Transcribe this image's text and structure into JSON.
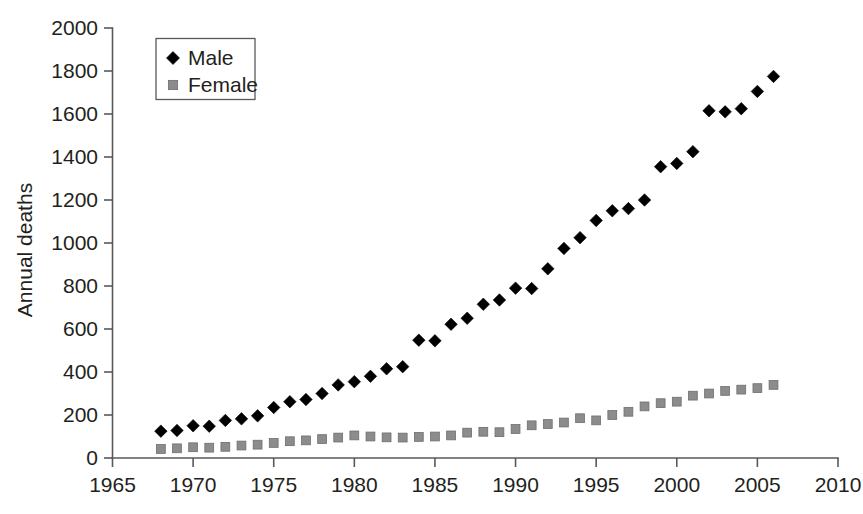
{
  "chart_data": {
    "type": "scatter",
    "title": "",
    "xlabel": "",
    "ylabel": "Annual deaths",
    "xlim": [
      1965,
      2010
    ],
    "ylim": [
      0,
      2000
    ],
    "xticks": [
      1965,
      1970,
      1975,
      1980,
      1985,
      1990,
      1995,
      2000,
      2005,
      2010
    ],
    "yticks": [
      0,
      200,
      400,
      600,
      800,
      1000,
      1200,
      1400,
      1600,
      1800,
      2000
    ],
    "grid": false,
    "legend_position": "top-left",
    "series": [
      {
        "name": "Male",
        "marker": "diamond",
        "color": "#000000",
        "x": [
          1968,
          1969,
          1970,
          1971,
          1972,
          1973,
          1974,
          1975,
          1976,
          1977,
          1978,
          1979,
          1980,
          1981,
          1982,
          1983,
          1984,
          1985,
          1986,
          1987,
          1988,
          1989,
          1990,
          1991,
          1992,
          1993,
          1994,
          1995,
          1996,
          1997,
          1998,
          1999,
          2000,
          2001,
          2002,
          2003,
          2004,
          2005,
          2006
        ],
        "values": [
          125,
          128,
          150,
          148,
          175,
          182,
          196,
          235,
          262,
          272,
          300,
          340,
          355,
          380,
          415,
          425,
          548,
          545,
          622,
          650,
          715,
          735,
          790,
          788,
          880,
          975,
          1025,
          1105,
          1150,
          1160,
          1200,
          1355,
          1370,
          1425,
          1615,
          1610,
          1625,
          1705,
          1775
        ],
        "label_last": 1775
      },
      {
        "name": "Female",
        "marker": "square",
        "color": "#8c8c8c",
        "x": [
          1968,
          1969,
          1970,
          1971,
          1972,
          1973,
          1974,
          1975,
          1976,
          1977,
          1978,
          1979,
          1980,
          1981,
          1982,
          1983,
          1984,
          1985,
          1986,
          1987,
          1988,
          1989,
          1990,
          1991,
          1992,
          1993,
          1994,
          1995,
          1996,
          1997,
          1998,
          1999,
          2000,
          2001,
          2002,
          2003,
          2004,
          2005,
          2006
        ],
        "values": [
          42,
          45,
          50,
          48,
          52,
          58,
          62,
          70,
          78,
          82,
          88,
          95,
          105,
          100,
          96,
          95,
          98,
          100,
          105,
          118,
          122,
          120,
          135,
          152,
          158,
          165,
          185,
          175,
          200,
          215,
          240,
          255,
          262,
          290,
          300,
          312,
          318,
          325,
          340
        ],
        "label_last": 340
      }
    ]
  },
  "legend": {
    "items": [
      {
        "label": "Male",
        "marker": "diamond",
        "color": "#000000"
      },
      {
        "label": "Female",
        "marker": "square",
        "color": "#8c8c8c"
      }
    ]
  },
  "axes": {
    "y_title": "Annual deaths"
  }
}
